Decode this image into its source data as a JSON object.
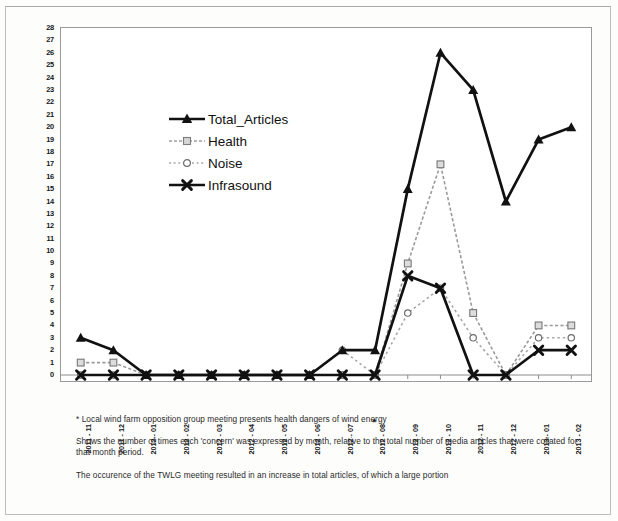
{
  "chart_data": {
    "type": "line",
    "title": "",
    "xlabel": "",
    "ylabel": "",
    "ylim": [
      0,
      28
    ],
    "ytick_step": 1,
    "grid": false,
    "legend_position": "inside-upper-left",
    "categories": [
      "2011 - 11",
      "2011 - 12",
      "2012 - 01",
      "2012 - 02",
      "2012 - 03",
      "2012 - 04",
      "2012 - 05",
      "2012 - 06",
      "2012 - 07",
      "2012 - 08",
      "2012 - 09",
      "2012 - 10",
      "2012 - 11",
      "2012 - 12",
      "2013 - 01",
      "2013 - 02"
    ],
    "annotated_category": "2012 - 08",
    "annotation_marker": "*",
    "series": [
      {
        "name": "Total_Articles",
        "marker": "triangle",
        "color": "#111111",
        "line": "solid",
        "values": [
          3,
          2,
          0,
          0,
          0,
          0,
          0,
          0,
          2,
          2,
          15,
          26,
          23,
          14,
          19,
          20
        ]
      },
      {
        "name": "Health",
        "marker": "square",
        "color": "#9a9a9a",
        "line": "dotted",
        "values": [
          1,
          1,
          0,
          0,
          0,
          0,
          0,
          0,
          0,
          0,
          9,
          17,
          5,
          0,
          4,
          4
        ]
      },
      {
        "name": "Noise",
        "marker": "circle",
        "color": "#a6a6a6",
        "line": "dashed",
        "values": [
          0,
          0,
          0,
          0,
          0,
          0,
          0,
          0,
          2,
          0,
          5,
          7,
          3,
          0,
          3,
          3
        ]
      },
      {
        "name": "Infrasound",
        "marker": "cross",
        "color": "#111111",
        "line": "solid",
        "values": [
          0,
          0,
          0,
          0,
          0,
          0,
          0,
          0,
          0,
          0,
          8,
          7,
          0,
          0,
          2,
          2
        ]
      }
    ],
    "ytick_labels": [
      "28",
      "27",
      "26",
      "25",
      "24",
      "23",
      "22",
      "21",
      "20",
      "19",
      "18",
      "17",
      "16",
      "15",
      "14",
      "13",
      "12",
      "11",
      "10",
      "9",
      "8",
      "7",
      "6",
      "5",
      "4",
      "3",
      "2",
      "1",
      "0"
    ]
  },
  "legend": {
    "items": [
      {
        "label": "Total_Articles",
        "key": "triangle-line-key"
      },
      {
        "label": "Health",
        "key": "square-line-key"
      },
      {
        "label": "Noise",
        "key": "circle-line-key"
      },
      {
        "label": "Infrasound",
        "key": "cross-line-key"
      }
    ]
  },
  "captions": {
    "footnote": "* Local wind farm opposition group meeting presents health dangers of wind energy",
    "description": "Shows the number of times each 'concern' was expressed by month, relative to the total number of media articles that were collated for that month period.",
    "conclusion": "The occurence of the TWLG meeting resulted in an increase in total articles, of which a large portion"
  }
}
